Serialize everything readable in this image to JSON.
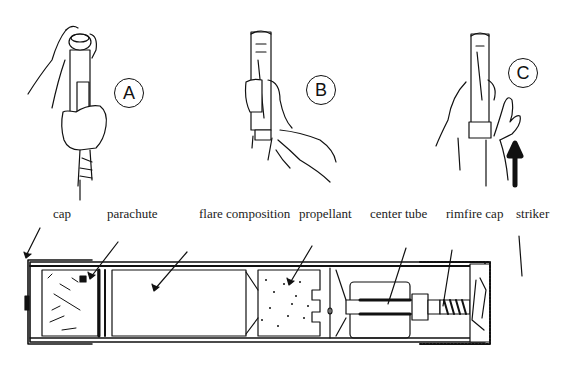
{
  "steps": [
    {
      "id": "A",
      "label": "A",
      "tube_text": "PAIN"
    },
    {
      "id": "B",
      "label": "B",
      "tube_text": "PRANNS"
    },
    {
      "id": "C",
      "label": "C",
      "tube_text": "PRANS"
    }
  ],
  "cross_section": {
    "labels": [
      {
        "key": "cap",
        "text": "cap"
      },
      {
        "key": "parachute",
        "text": "parachute"
      },
      {
        "key": "flare_composition",
        "text": "flare composition"
      },
      {
        "key": "propellant",
        "text": "propellant"
      },
      {
        "key": "center_tube",
        "text": "center tube"
      },
      {
        "key": "rimfire_cap",
        "text": "rimfire cap"
      },
      {
        "key": "striker",
        "text": "striker"
      }
    ]
  },
  "colors": {
    "ink": "#111111",
    "paper": "#ffffff"
  }
}
